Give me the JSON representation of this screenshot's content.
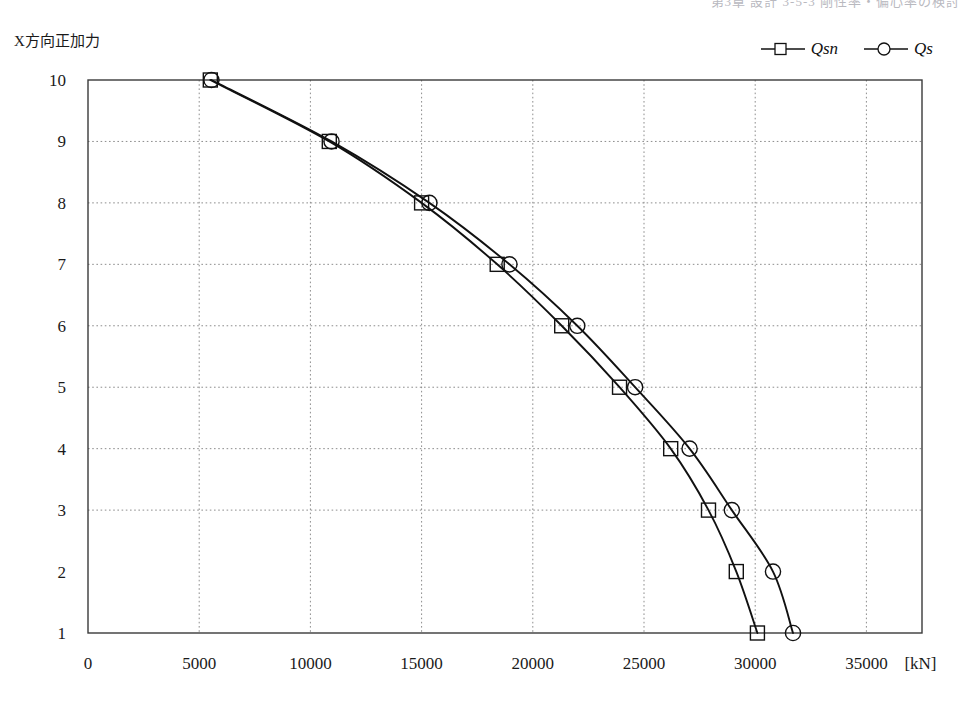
{
  "header": {
    "ghost_text": "第3章 設計 3-5-3 剛性率・偏心率の検討"
  },
  "chart_data": {
    "type": "line",
    "title": "",
    "ylabel": "X方向正加力",
    "xlabel": "",
    "x_unit": "[kN]",
    "xlim": [
      0,
      37500
    ],
    "ylim": [
      1,
      10
    ],
    "xticks": [
      0,
      5000,
      10000,
      15000,
      20000,
      25000,
      30000,
      35000
    ],
    "xtick_labels": [
      "0",
      "5000",
      "10000",
      "15000",
      "20000",
      "25000",
      "30000",
      "35000"
    ],
    "yticks": [
      1,
      2,
      3,
      4,
      5,
      6,
      7,
      8,
      9,
      10
    ],
    "ytick_labels": [
      "1",
      "2",
      "3",
      "4",
      "5",
      "6",
      "7",
      "8",
      "9",
      "10"
    ],
    "grid": true,
    "grid_style": "dotted",
    "grid_x_values": [
      5000,
      10000,
      15000,
      20000,
      25000,
      30000,
      35000
    ],
    "grid_y_values": [
      3,
      4,
      5,
      6,
      7,
      8,
      9
    ],
    "legend_position": "top-right",
    "series": [
      {
        "name": "Qsn",
        "marker": "square",
        "color": "#111111",
        "points": [
          {
            "y": 10,
            "x": 5500
          },
          {
            "y": 9,
            "x": 10850
          },
          {
            "y": 8,
            "x": 15000
          },
          {
            "y": 7,
            "x": 18400
          },
          {
            "y": 6,
            "x": 21300
          },
          {
            "y": 5,
            "x": 23900
          },
          {
            "y": 4,
            "x": 26200
          },
          {
            "y": 3,
            "x": 27900
          },
          {
            "y": 2,
            "x": 29150
          },
          {
            "y": 1,
            "x": 30100
          }
        ]
      },
      {
        "name": "Qs",
        "marker": "circle",
        "color": "#111111",
        "points": [
          {
            "y": 10,
            "x": 5550
          },
          {
            "y": 9,
            "x": 10950
          },
          {
            "y": 8,
            "x": 15350
          },
          {
            "y": 7,
            "x": 18950
          },
          {
            "y": 6,
            "x": 22000
          },
          {
            "y": 5,
            "x": 24600
          },
          {
            "y": 4,
            "x": 27050
          },
          {
            "y": 3,
            "x": 28950
          },
          {
            "y": 2,
            "x": 30800
          },
          {
            "y": 1,
            "x": 31700
          }
        ]
      }
    ]
  },
  "legend": {
    "items": [
      {
        "label": "Qsn",
        "marker": "square"
      },
      {
        "label": "Qs",
        "marker": "circle"
      }
    ]
  }
}
